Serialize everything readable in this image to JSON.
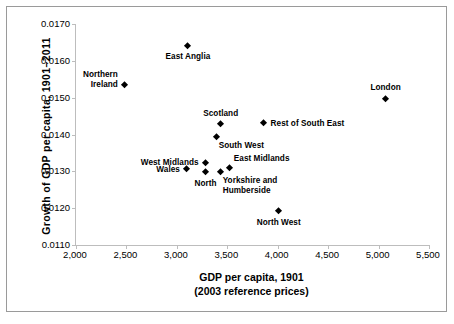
{
  "chart_data": {
    "type": "scatter",
    "title": "",
    "xlabel": "GDP per capita, 1901",
    "xlabel_line2": "(2003 reference prices)",
    "ylabel": "Growth of GDP per capita, 1901–2011",
    "xlim": [
      2000,
      5500
    ],
    "ylim": [
      0.011,
      0.017
    ],
    "xticks": [
      2000,
      2500,
      3000,
      3500,
      4000,
      4500,
      5000,
      5500
    ],
    "xtick_labels": [
      "2,000",
      "2,500",
      "3,000",
      "3,500",
      "4,000",
      "4,500",
      "5,000",
      "5,500"
    ],
    "yticks": [
      0.011,
      0.012,
      0.013,
      0.014,
      0.015,
      0.016,
      0.017
    ],
    "ytick_labels": [
      "0.0110",
      "0.0120",
      "0.0130",
      "0.0140",
      "0.0150",
      "0.0160",
      "0.0170"
    ],
    "grid": false,
    "legend": "none",
    "marker_shape": "diamond",
    "marker_color": "#000000",
    "points": [
      {
        "label": "East Anglia",
        "x": 3110,
        "y": 0.0164,
        "label_pos": "below",
        "label_lines": [
          "East Anglia"
        ]
      },
      {
        "label": "Northern Ireland",
        "x": 2485,
        "y": 0.01534,
        "label_pos": "left-two",
        "label_lines": [
          "Northern",
          "Ireland"
        ]
      },
      {
        "label": "London",
        "x": 5070,
        "y": 0.01496,
        "label_pos": "above",
        "label_lines": [
          "London"
        ]
      },
      {
        "label": "Rest of South East",
        "x": 3860,
        "y": 0.01429,
        "label_pos": "right",
        "label_lines": [
          "Rest of South East"
        ]
      },
      {
        "label": "Scotland",
        "x": 3435,
        "y": 0.01426,
        "label_pos": "above",
        "label_lines": [
          "Scotland"
        ]
      },
      {
        "label": "South West",
        "x": 3395,
        "y": 0.01393,
        "label_pos": "below-right",
        "label_lines": [
          "South West"
        ]
      },
      {
        "label": "West Midlands",
        "x": 3285,
        "y": 0.01322,
        "label_pos": "left",
        "label_lines": [
          "West Midlands"
        ]
      },
      {
        "label": "East Midlands",
        "x": 3525,
        "y": 0.01309,
        "label_pos": "above-right",
        "label_lines": [
          "East Midlands"
        ]
      },
      {
        "label": "Wales",
        "x": 3100,
        "y": 0.01304,
        "label_pos": "left",
        "label_lines": [
          "Wales"
        ]
      },
      {
        "label": "Yorkshire and Humberside",
        "x": 3435,
        "y": 0.01298,
        "label_pos": "below-right",
        "label_lines": [
          "Yorkshire and",
          "Humberside"
        ]
      },
      {
        "label": "North",
        "x": 3285,
        "y": 0.01296,
        "label_pos": "below",
        "label_lines": [
          "North"
        ]
      },
      {
        "label": "North West",
        "x": 4010,
        "y": 0.0119,
        "label_pos": "below",
        "label_lines": [
          "North West"
        ]
      }
    ]
  },
  "axis": {
    "y_title": "Growth of GDP per capita, 1901–2011",
    "x_title_line1": "GDP per capita, 1901",
    "x_title_line2": "(2003 reference prices)"
  },
  "colors": {
    "marker": "#000000",
    "axis_line": "#bdbdbd",
    "frame": "#9a9a9a",
    "text": "#000000",
    "background": "#ffffff"
  }
}
